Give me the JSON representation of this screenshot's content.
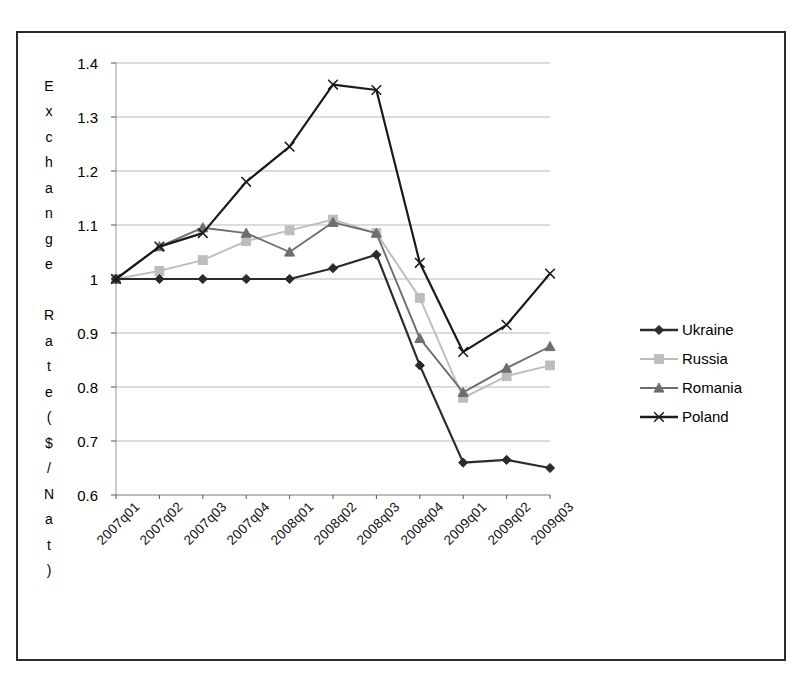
{
  "chart_data": {
    "type": "line",
    "title": "",
    "xlabel": "",
    "ylabel": "Exchange Rate ($/Nat)",
    "ylabel_chars": [
      "E",
      "x",
      "c",
      "h",
      "a",
      "n",
      "g",
      "e",
      "",
      "R",
      "a",
      "t",
      "e",
      "(",
      "$",
      "/",
      "N",
      "a",
      "t",
      ")"
    ],
    "categories": [
      "2007q01",
      "2007q02",
      "2007q03",
      "2007q04",
      "2008q01",
      "2008q02",
      "2008q03",
      "2008q04",
      "2009q01",
      "2009q02",
      "2009q03"
    ],
    "ylim": [
      0.6,
      1.4
    ],
    "yticks": [
      "0.6",
      "0.7",
      "0.8",
      "0.9",
      "1",
      "1.1",
      "1.2",
      "1.3",
      "1.4"
    ],
    "ytick_values": [
      0.6,
      0.7,
      0.8,
      0.9,
      1.0,
      1.1,
      1.2,
      1.3,
      1.4
    ],
    "grid": true,
    "legend_position": "right",
    "series": [
      {
        "name": "Ukraine",
        "marker": "diamond",
        "color": "#2b2b2b",
        "values": [
          1.0,
          1.0,
          1.0,
          1.0,
          1.0,
          1.02,
          1.045,
          0.84,
          0.66,
          0.665,
          0.65
        ]
      },
      {
        "name": "Russia",
        "marker": "square",
        "color": "#bdbdbd",
        "values": [
          1.0,
          1.015,
          1.035,
          1.07,
          1.09,
          1.11,
          1.085,
          0.965,
          0.78,
          0.82,
          0.84
        ]
      },
      {
        "name": "Romania",
        "marker": "triangle",
        "color": "#6e6e6e",
        "values": [
          1.0,
          1.06,
          1.095,
          1.085,
          1.05,
          1.105,
          1.085,
          0.89,
          0.79,
          0.835,
          0.875
        ]
      },
      {
        "name": "Poland",
        "marker": "x",
        "color": "#1a1a1a",
        "values": [
          1.0,
          1.06,
          1.085,
          1.18,
          1.245,
          1.36,
          1.35,
          1.03,
          0.865,
          0.915,
          1.01
        ]
      }
    ]
  },
  "legend": {
    "items": [
      {
        "label": "Ukraine"
      },
      {
        "label": "Russia"
      },
      {
        "label": "Romania"
      },
      {
        "label": "Poland"
      }
    ]
  }
}
